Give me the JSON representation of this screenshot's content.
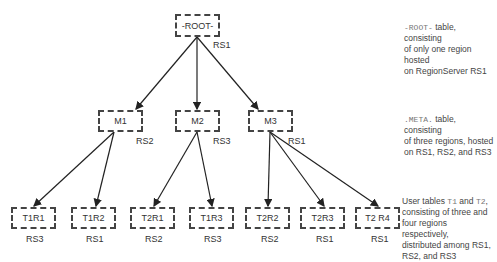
{
  "diagram": {
    "root": {
      "label": "-ROOT-",
      "server": "RS1"
    },
    "meta": [
      {
        "label": "M1",
        "server": "RS2"
      },
      {
        "label": "M2",
        "server": "RS3"
      },
      {
        "label": "M3",
        "server": "RS1"
      }
    ],
    "user": [
      {
        "label": "T1R1",
        "server": "RS3"
      },
      {
        "label": "T1R2",
        "server": "RS1"
      },
      {
        "label": "T2R1",
        "server": "RS2"
      },
      {
        "label": "T1R3",
        "server": "RS3"
      },
      {
        "label": "T2R2",
        "server": "RS2"
      },
      {
        "label": "T2R3",
        "server": "RS1"
      },
      {
        "label": "T2 R4",
        "server": "RS1"
      }
    ],
    "edges": [
      [
        "-ROOT-",
        "M1"
      ],
      [
        "-ROOT-",
        "M2"
      ],
      [
        "-ROOT-",
        "M3"
      ],
      [
        "M1",
        "T1R1"
      ],
      [
        "M1",
        "T1R2"
      ],
      [
        "M2",
        "T2R1"
      ],
      [
        "M2",
        "T1R3"
      ],
      [
        "M3",
        "T2R2"
      ],
      [
        "M3",
        "T2R3"
      ],
      [
        "M3",
        "T2 R4"
      ]
    ]
  },
  "notes": {
    "root": {
      "code": "-ROOT-",
      "text1": " table, consisting",
      "text2": "of only one region hosted",
      "text3": "on RegionServer RS1"
    },
    "meta": {
      "code": ".META.",
      "text1": " table, consisting",
      "text2": "of three regions, hosted",
      "text3": "on RS1, RS2, and RS3"
    },
    "user": {
      "pre": "User tables ",
      "code1": "T1",
      "mid": " and ",
      "code2": "T2",
      "post": ",",
      "text2": "consisting of three and",
      "text3": "four regions respectively,",
      "text4": "distributed among RS1,",
      "text5": "RS2, and RS3"
    }
  }
}
